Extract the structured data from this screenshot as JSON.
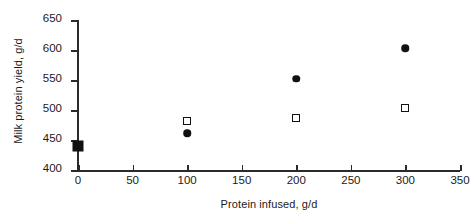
{
  "chart_data": {
    "type": "scatter",
    "title": "",
    "xlabel": "Protein infused, g/d",
    "ylabel": "Milk protein yield, g/d",
    "xlim": [
      0,
      350
    ],
    "ylim": [
      400,
      650
    ],
    "xticks": [
      0,
      50,
      100,
      150,
      200,
      250,
      300,
      350
    ],
    "yticks": [
      400,
      450,
      500,
      550,
      600,
      650
    ],
    "xtick_labels": [
      "0",
      "50",
      "100",
      "150",
      "200",
      "250",
      "300",
      "350"
    ],
    "ytick_labels": [
      "400",
      "450",
      "500",
      "550",
      "600",
      "650"
    ],
    "grid": false,
    "legend": false,
    "series": [
      {
        "name": "filled-circle",
        "marker": "circle-filled",
        "color": "#111111",
        "points": [
          {
            "x": 100,
            "y": 461
          },
          {
            "x": 200,
            "y": 552
          },
          {
            "x": 300,
            "y": 603
          }
        ]
      },
      {
        "name": "open-square",
        "marker": "square-open",
        "color": "#111111",
        "points": [
          {
            "x": 100,
            "y": 481
          },
          {
            "x": 200,
            "y": 487
          },
          {
            "x": 300,
            "y": 503
          }
        ]
      },
      {
        "name": "control-filled-square",
        "marker": "square-filled",
        "color": "#111111",
        "points": [
          {
            "x": 0,
            "y": 440
          }
        ]
      }
    ]
  }
}
